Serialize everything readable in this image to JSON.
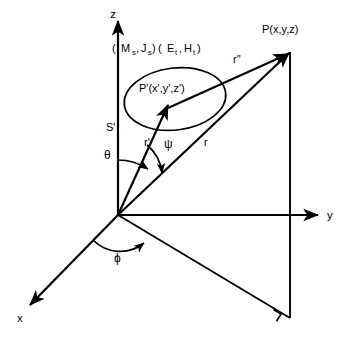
{
  "figure": {
    "kind": "coordinate-system-vector-diagram",
    "background_color": "#ffffff",
    "line_color": "#000000"
  },
  "axes": {
    "z_label": "z",
    "y_label": "y",
    "x_label": "x"
  },
  "points": {
    "field_point_label": "P(x,y,z)",
    "source_point_label": "P'(x',y',z')"
  },
  "surface": {
    "label": "S'"
  },
  "sources": {
    "magnetic_current_label": "M",
    "magnetic_current_sub": "s",
    "electric_current_label": "J",
    "electric_current_sub": "s",
    "e_field_label": "E",
    "e_field_sub": "t",
    "h_field_label": "H",
    "h_field_sub": "t",
    "open_paren": "(",
    "comma": ",",
    "close_paren": ")",
    "full_text": "( M_s , J_s )( E_t , H_t )"
  },
  "vectors": {
    "r_label": "r",
    "r_prime_label": "r'",
    "r_double_prime_label": "r\""
  },
  "angles": {
    "theta_label": "θ",
    "psi_label": "ψ",
    "phi_label": "ϕ"
  },
  "markers": {
    "right_angle": "right-angle-marker"
  }
}
